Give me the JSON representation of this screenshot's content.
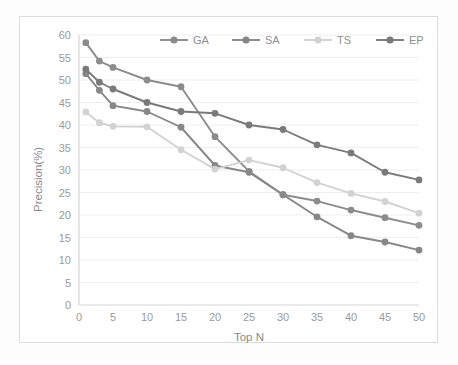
{
  "chart_data": {
    "type": "line",
    "title": "",
    "xlabel": "Top N",
    "ylabel": "Precision(%)",
    "x": [
      1,
      3,
      5,
      10,
      15,
      20,
      25,
      30,
      35,
      40,
      45,
      50
    ],
    "xlim": [
      0,
      50
    ],
    "ylim": [
      0,
      60
    ],
    "xticks": [
      0,
      5,
      10,
      15,
      20,
      25,
      30,
      35,
      40,
      45,
      50
    ],
    "yticks": [
      0,
      5,
      10,
      15,
      20,
      25,
      30,
      35,
      40,
      45,
      50,
      55,
      60
    ],
    "xtick_labels": [
      "0",
      "5",
      "10",
      "15",
      "20",
      "25",
      "30",
      "35",
      "40",
      "45",
      "50"
    ],
    "ytick_labels": [
      "0",
      "5",
      "10",
      "15",
      "20",
      "25",
      "30",
      "35",
      "40",
      "45",
      "50",
      "55",
      "60"
    ],
    "grid": "horizontal",
    "legend_position": "top-center",
    "marker": "circle",
    "series": [
      {
        "name": "GA",
        "color": "#8c8c8c",
        "values": [
          58.3,
          54.2,
          52.8,
          50.0,
          48.5,
          37.4,
          29.7,
          24.5,
          23.1,
          21.1,
          19.4,
          17.7
        ]
      },
      {
        "name": "SA",
        "color": "#878787",
        "values": [
          51.4,
          47.7,
          44.3,
          43.0,
          39.5,
          31.0,
          29.5,
          24.5,
          19.6,
          15.4,
          14.0,
          12.2
        ]
      },
      {
        "name": "TS",
        "color": "#d2d2d2",
        "values": [
          42.9,
          40.5,
          39.7,
          39.6,
          34.5,
          30.2,
          32.2,
          30.5,
          27.2,
          24.8,
          23.0,
          20.4
        ]
      },
      {
        "name": "EP",
        "color": "#7a7a7a",
        "values": [
          52.4,
          49.5,
          48.0,
          45.0,
          43.0,
          42.6,
          40.0,
          39.0,
          35.6,
          33.8,
          29.5,
          27.8
        ]
      }
    ]
  },
  "legend": {
    "entries": [
      {
        "label": "GA"
      },
      {
        "label": "SA"
      },
      {
        "label": "TS"
      },
      {
        "label": "EP"
      }
    ]
  },
  "axes": {
    "y_title": "Precision(%)",
    "x_title": "Top N"
  }
}
